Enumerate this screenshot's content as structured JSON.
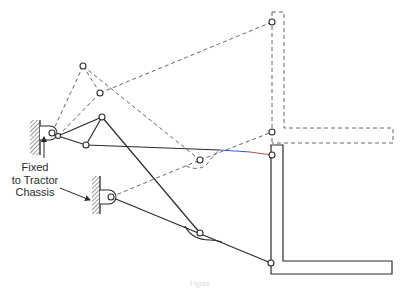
{
  "diagram": {
    "type": "linkage-mechanism",
    "label": {
      "line1": "Fixed",
      "line2": "to Tractor",
      "line3": "Chassis"
    },
    "caption": "Figure",
    "colors": {
      "line": "#2b2b2b",
      "dashed": "#555555",
      "hatch": "#333333",
      "accent_blue": "#3a5fcd",
      "accent_red": "#c0504d"
    },
    "fixed_pivots": [
      {
        "id": "upper-pivot",
        "x": 52,
        "y": 133
      },
      {
        "id": "lower-pivot",
        "x": 111,
        "y": 197
      }
    ],
    "solid_position": {
      "triangle": [
        [
          58,
          136
        ],
        [
          102,
          117
        ],
        [
          86,
          145
        ]
      ],
      "rocker_pin": [
        200,
        233
      ],
      "frame_pins": [
        [
          272,
          155
        ],
        [
          271,
          263
        ]
      ]
    },
    "dashed_position": {
      "points": [
        [
          83,
          66
        ],
        [
          100,
          93
        ]
      ],
      "rocker_pin": [
        200,
        160
      ],
      "frame_pins": [
        [
          272,
          22
        ],
        [
          272,
          132
        ]
      ]
    }
  }
}
